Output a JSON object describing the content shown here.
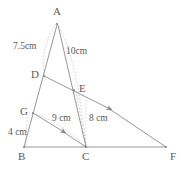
{
  "figure": {
    "type": "geometry-diagram",
    "background_color": "#ffffff",
    "stroke_color": "#7a7a7a",
    "text_color": "#5a5a5a"
  },
  "vertices": [
    {
      "id": "A",
      "label": "A",
      "x": 57,
      "y": 22,
      "label_x": 53,
      "label_y": 6
    },
    {
      "id": "D",
      "label": "D",
      "x": 44,
      "y": 76,
      "label_x": 31,
      "label_y": 69
    },
    {
      "id": "E",
      "label": "E",
      "x": 74,
      "y": 90,
      "label_x": 79,
      "label_y": 83
    },
    {
      "id": "G",
      "label": "G",
      "x": 33,
      "y": 113,
      "label_x": 20,
      "label_y": 106
    },
    {
      "id": "B",
      "label": "B",
      "x": 24,
      "y": 148,
      "label_x": 18,
      "label_y": 151
    },
    {
      "id": "C",
      "label": "C",
      "x": 86,
      "y": 148,
      "label_x": 82,
      "label_y": 151
    },
    {
      "id": "F",
      "label": "F",
      "x": 166,
      "y": 148,
      "label_x": 170,
      "label_y": 151
    }
  ],
  "segments": [
    {
      "name": "side-AB",
      "from": "A",
      "to": "B",
      "style": "solid"
    },
    {
      "name": "side-AC",
      "from": "A",
      "to": "C",
      "style": "solid"
    },
    {
      "name": "side-BF",
      "from": "B",
      "to": "F",
      "style": "solid"
    },
    {
      "name": "segment-DF",
      "from": "D",
      "to": "F",
      "style": "solid",
      "arrow": true
    },
    {
      "name": "segment-GC",
      "from": "G",
      "to": "C",
      "style": "solid",
      "arrow": true
    },
    {
      "name": "dashed-A-to-C",
      "from": "A",
      "to": "C",
      "style": "dashed"
    },
    {
      "name": "dashed-A-to-D",
      "from": "A",
      "to": "D",
      "style": "dashed"
    },
    {
      "name": "dashed-G-to-C",
      "from": "G",
      "to": "C",
      "style": "dashed"
    },
    {
      "name": "dashed-C-vertical",
      "from": "E",
      "to": "C",
      "style": "dashed"
    },
    {
      "name": "dashed-B-to-G",
      "from": "B",
      "to": "G",
      "style": "dashed"
    }
  ],
  "measurements": [
    {
      "name": "measure-AD",
      "text": "7.5cm",
      "x": 13,
      "y": 42,
      "for": "AD"
    },
    {
      "name": "measure-AE",
      "text": "10cm",
      "x": 66,
      "y": 47,
      "for": "AE"
    },
    {
      "name": "measure-GC",
      "text": "9 cm",
      "x": 52,
      "y": 114,
      "for": "GC"
    },
    {
      "name": "measure-EC",
      "text": "8 cm",
      "x": 89,
      "y": 114,
      "for": "EC"
    },
    {
      "name": "measure-BG",
      "text": "4 cm",
      "x": 8,
      "y": 128,
      "for": "BG"
    }
  ]
}
